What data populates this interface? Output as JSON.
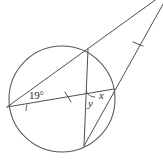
{
  "diagram": {
    "kind": "circle-geometry-diagram",
    "background_color": "#ffffff",
    "stroke_color": "#4a4a4a",
    "labels": {
      "angle_19": "19°",
      "angle_x": "x",
      "angle_y": "y"
    },
    "circle": {
      "center_x": 62,
      "center_y": 99,
      "radius": 53
    },
    "points": {
      "left_vertex": {
        "x": 7,
        "y": 107
      },
      "top_chord_point": {
        "x": 88,
        "y": 49
      },
      "bottom_chord_point": {
        "x": 84,
        "y": 146
      },
      "right_chord_point": {
        "x": 113,
        "y": 90
      },
      "external_apex": {
        "x": 168,
        "y": -8
      }
    },
    "segments": [
      {
        "name": "secant-through-top",
        "from": "left_vertex",
        "to": "external_apex"
      },
      {
        "name": "secant-through-right",
        "from": "bottom_chord_point",
        "to": "external_apex"
      },
      {
        "name": "chord-vertical",
        "from": "top_chord_point",
        "to": "bottom_chord_point"
      },
      {
        "name": "chord-left-to-right",
        "from": "left_vertex",
        "to": "right_chord_point"
      }
    ],
    "tick_marks": [
      {
        "name": "tick-on-chord-left-to-right",
        "x": 68,
        "y": 97
      },
      {
        "name": "tick-on-secant-through-right",
        "x": 138,
        "y": 44
      }
    ],
    "angle_arcs": [
      {
        "name": "arc-angle-19",
        "at": "left_vertex"
      },
      {
        "name": "arc-angle-y",
        "at": "intersection-right"
      }
    ]
  }
}
